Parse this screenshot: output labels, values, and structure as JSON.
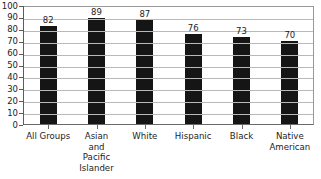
{
  "chart_data": {
    "type": "bar",
    "title": "",
    "subtitle": "",
    "xlabel": "",
    "ylabel": "",
    "categories": [
      "All Groups",
      "Asian and Pacific Islander",
      "White",
      "Hispanic",
      "Black",
      "Native American"
    ],
    "category_lines": [
      [
        "All Groups"
      ],
      [
        "Asian",
        "and",
        "Pacific",
        "Islander"
      ],
      [
        "White"
      ],
      [
        "Hispanic"
      ],
      [
        "Black"
      ],
      [
        "Native",
        "American"
      ]
    ],
    "values": [
      82,
      89,
      87,
      76,
      73,
      70
    ],
    "value_labels": [
      "82",
      "89",
      "87",
      "76",
      "73",
      "70"
    ],
    "ylim": [
      0,
      100
    ],
    "ytick_step": 10,
    "yticks": [
      100,
      90,
      80,
      70,
      60,
      50,
      40,
      30,
      20,
      10,
      0
    ],
    "ytick_labels": [
      "100",
      "90",
      "80",
      "70",
      "60",
      "50",
      "40",
      "30",
      "20",
      "10",
      "0"
    ],
    "grid": true,
    "grid_axis": "y",
    "legend": false,
    "legend_position": "none",
    "bar_color": "#151515",
    "gridline_color": "#b9b9b9",
    "axis_color": "#6a6a6a",
    "background_color": "#ffffff",
    "text_color": "#1c1c1c"
  }
}
